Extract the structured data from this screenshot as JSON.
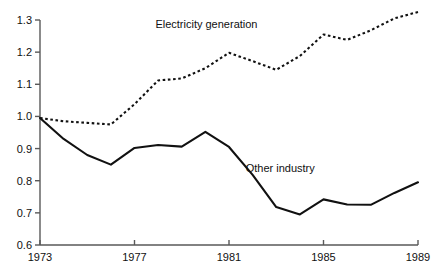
{
  "chart_data": {
    "type": "line",
    "title": "",
    "subtitle": "",
    "xlabel": "",
    "ylabel": "",
    "xlim": [
      1973,
      1989
    ],
    "ylim": [
      0.6,
      1.3
    ],
    "grid": false,
    "legend_position": "inline-annotation",
    "x_tick_labels": [
      "1973",
      "1977",
      "1981",
      "1985",
      "1989"
    ],
    "x_tick_values": [
      1973,
      1977,
      1981,
      1985,
      1989
    ],
    "x_minor_tick_values": [
      1973,
      1977,
      1981,
      1985,
      1989
    ],
    "y_tick_labels": [
      "0.6",
      "0.7",
      "0.8",
      "0.9",
      "1.0",
      "1.1",
      "1.2",
      "1.3"
    ],
    "y_tick_values": [
      0.6,
      0.7,
      0.8,
      0.9,
      1.0,
      1.1,
      1.2,
      1.3
    ],
    "x": [
      1973,
      1974,
      1975,
      1976,
      1977,
      1978,
      1979,
      1980,
      1981,
      1982,
      1983,
      1984,
      1985,
      1986,
      1987,
      1988,
      1989
    ],
    "series": [
      {
        "name": "Electricity generation",
        "style": "dotted",
        "color": "#111111",
        "label_x": 1980.0,
        "label_y": 1.285,
        "values": [
          0.995,
          0.985,
          0.98,
          0.975,
          1.038,
          1.112,
          1.118,
          1.15,
          1.198,
          1.172,
          1.145,
          1.188,
          1.255,
          1.238,
          1.268,
          1.305,
          1.325
        ]
      },
      {
        "name": "Other industry",
        "style": "solid",
        "color": "#111111",
        "label_x": 1983.4,
        "label_y": 0.838,
        "values": [
          0.995,
          0.93,
          0.88,
          0.85,
          0.902,
          0.911,
          0.906,
          0.952,
          0.905,
          0.818,
          0.718,
          0.695,
          0.742,
          0.726,
          0.725,
          0.762,
          0.795
        ]
      }
    ],
    "axis": {
      "color": "#595959",
      "line_width": 1.4
    }
  },
  "y_axis_labels": [
    {
      "text": "1.3",
      "value": 1.3
    },
    {
      "text": "1.2",
      "value": 1.2
    },
    {
      "text": "1.1",
      "value": 1.1
    },
    {
      "text": "1.0",
      "value": 1.0
    },
    {
      "text": "0.9",
      "value": 0.9
    },
    {
      "text": "0.8",
      "value": 0.8
    },
    {
      "text": "0.7",
      "value": 0.7
    },
    {
      "text": "0.6",
      "value": 0.6
    }
  ],
  "x_axis_labels": [
    {
      "text": "1973",
      "value": 1973
    },
    {
      "text": "1977",
      "value": 1977
    },
    {
      "text": "1981",
      "value": 1981
    },
    {
      "text": "1985",
      "value": 1985
    },
    {
      "text": "1989",
      "value": 1989
    }
  ],
  "annotations": {
    "electricity": "Electricity generation",
    "other_industry": "Other industry"
  }
}
